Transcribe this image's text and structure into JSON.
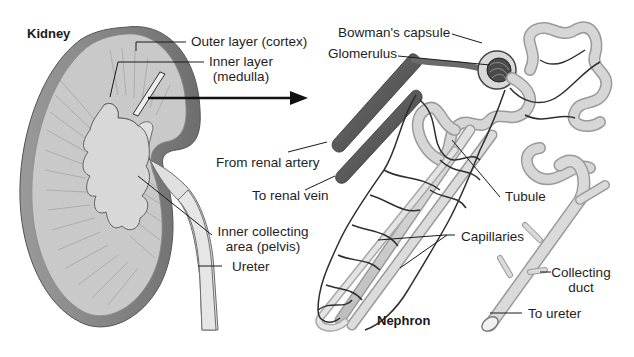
{
  "figure": {
    "left_title": "Kidney",
    "right_title": "Nephron"
  },
  "kidney_labels": {
    "outer_layer": "Outer layer (cortex)",
    "inner_layer_line1": "Inner layer",
    "inner_layer_line2": "(medulla)",
    "pelvis_line1": "Inner collecting",
    "pelvis_line2": "area (pelvis)",
    "ureter": "Ureter"
  },
  "nephron_labels": {
    "bowmans_capsule": "Bowman's capsule",
    "glomerulus": "Glomerulus",
    "renal_artery": "From renal artery",
    "renal_vein": "To renal vein",
    "tubule": "Tubule",
    "capillaries": "Capillaries",
    "collecting_duct_line1": "Collecting",
    "collecting_duct_line2": "duct",
    "to_ureter": "To ureter"
  },
  "colors": {
    "kidney_outer": "#8a8a8a",
    "kidney_cortex": "#c8c8c8",
    "kidney_medulla": "#b4b4b4",
    "pelvis": "#dcdcdc",
    "vessel_dark": "#555555",
    "tubule": "#d2d2d2",
    "capillary": "#2e2e2e",
    "leader": "#1a1a1a"
  }
}
